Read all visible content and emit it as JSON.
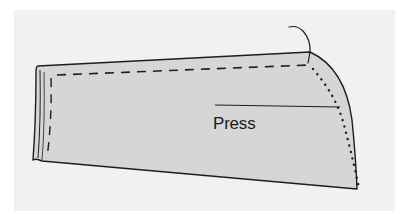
{
  "diagram": {
    "annotations": [
      {
        "id": "press",
        "label": "Press"
      }
    ],
    "colors": {
      "panel_background": "#f1f1f1",
      "fabric_fill": "#d6d6d6",
      "outline": "#1e1e1e"
    },
    "elements": {
      "fabric_outline": "solid outline",
      "stitch_line": "dashed line",
      "fold_line": "dotted curved line",
      "thread": "loose thread end",
      "leader_line": "press pointer line"
    }
  }
}
